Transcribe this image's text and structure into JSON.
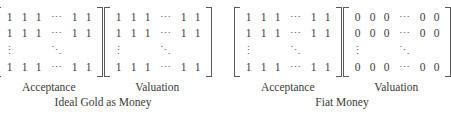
{
  "figure": {
    "ink_color": "#3a3a3a",
    "bracket_color": "#595959",
    "background_color": "#ffffff",
    "glyphs": {
      "hdots": "⋯",
      "vdots": "⋮",
      "ddots": "⋱"
    }
  },
  "groups": [
    {
      "id": "ideal-gold-as-money",
      "caption": "Ideal Gold as Money",
      "matrices": [
        {
          "id": "acceptance-gold",
          "label": "Acceptance",
          "fill_value": "1",
          "rows": [
            [
              "1",
              "1",
              "1",
              "⋯",
              "1",
              "1"
            ],
            [
              "1",
              "1",
              "1",
              "⋯",
              "1",
              "1"
            ],
            [
              "⋮",
              "",
              "",
              "⋱",
              "",
              ""
            ],
            [
              "1",
              "1",
              "1",
              "⋯",
              "1",
              "1"
            ]
          ]
        },
        {
          "id": "valuation-gold",
          "label": "Valuation",
          "fill_value": "1",
          "rows": [
            [
              "1",
              "1",
              "1",
              "⋯",
              "1",
              "1"
            ],
            [
              "1",
              "1",
              "1",
              "⋯",
              "1",
              "1"
            ],
            [
              "⋮",
              "",
              "",
              "⋱",
              "",
              ""
            ],
            [
              "1",
              "1",
              "1",
              "⋯",
              "1",
              "1"
            ]
          ]
        }
      ]
    },
    {
      "id": "fiat-money",
      "caption": "Fiat Money",
      "matrices": [
        {
          "id": "acceptance-fiat",
          "label": "Acceptance",
          "fill_value": "1",
          "rows": [
            [
              "1",
              "1",
              "1",
              "⋯",
              "1",
              "1"
            ],
            [
              "1",
              "1",
              "1",
              "⋯",
              "1",
              "1"
            ],
            [
              "⋮",
              "",
              "",
              "⋱",
              "",
              ""
            ],
            [
              "1",
              "1",
              "1",
              "⋯",
              "1",
              "1"
            ]
          ]
        },
        {
          "id": "valuation-fiat",
          "label": "Valuation",
          "fill_value": "0",
          "rows": [
            [
              "0",
              "0",
              "0",
              "⋯",
              "0",
              "0"
            ],
            [
              "0",
              "0",
              "0",
              "⋯",
              "0",
              "0"
            ],
            [
              "⋮",
              "",
              "",
              "⋱",
              "",
              ""
            ],
            [
              "0",
              "0",
              "0",
              "⋯",
              "0",
              "0"
            ]
          ]
        }
      ]
    }
  ]
}
